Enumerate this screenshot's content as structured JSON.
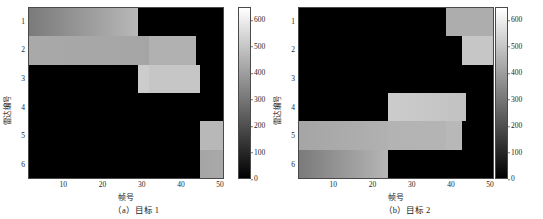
{
  "figure": {
    "title": "",
    "panels": [
      {
        "id": "a",
        "caption": "（a）目标 1",
        "xlabel": "帧号",
        "ylabel": "雷达编号",
        "xticks": [
          "10",
          "20",
          "30",
          "40",
          "50"
        ],
        "yticks": [
          "1",
          "2",
          "3",
          "4",
          "5",
          "6"
        ],
        "colorbar_ticks": [
          "600",
          "500",
          "400",
          "300",
          "200",
          "100",
          "0"
        ]
      },
      {
        "id": "b",
        "caption": "（b）目标 2",
        "xlabel": "帧号",
        "ylabel": "雷达编号",
        "xticks": [
          "10",
          "20",
          "30",
          "40",
          "50"
        ],
        "yticks": [
          "1",
          "2",
          "3",
          "4",
          "5",
          "6"
        ],
        "colorbar_ticks": [
          "600",
          "500",
          "400",
          "300",
          "200",
          "100",
          "0"
        ]
      }
    ]
  },
  "chart_data": [
    {
      "type": "heatmap",
      "panel": "a",
      "title": "（a）目标 1",
      "xlabel": "帧号",
      "ylabel": "雷达编号",
      "xlim": [
        1,
        51
      ],
      "ylim": [
        0.5,
        6.5
      ],
      "xticks": [
        10,
        20,
        30,
        40,
        50
      ],
      "yticks": [
        1,
        2,
        3,
        4,
        5,
        6
      ],
      "colormap": "gray",
      "clim": [
        0,
        650
      ],
      "colorbar_ticks": [
        0,
        100,
        200,
        300,
        400,
        500,
        600
      ],
      "colorbar_position": "right",
      "grid": false,
      "background_value": 0,
      "note": "Value 0 renders black; assigned radar-to-target ranges render as a left-to-right brightening gradient.",
      "blocks": [
        {
          "radar": 1,
          "frame_start": 1,
          "frame_end": 29,
          "value_start": 310,
          "value_end": 470
        },
        {
          "radar": 2,
          "frame_start": 1,
          "frame_end": 32,
          "value_start": 430,
          "value_end": 420
        },
        {
          "radar": 2,
          "frame_start": 32,
          "frame_end": 44,
          "value_start": 450,
          "value_end": 450
        },
        {
          "radar": 3,
          "frame_start": 29,
          "frame_end": 32,
          "value_start": 520,
          "value_end": 520
        },
        {
          "radar": 3,
          "frame_start": 32,
          "frame_end": 45,
          "value_start": 505,
          "value_end": 505
        },
        {
          "radar": 5,
          "frame_start": 45,
          "frame_end": 51,
          "value_start": 470,
          "value_end": 470
        },
        {
          "radar": 6,
          "frame_start": 45,
          "frame_end": 51,
          "value_start": 420,
          "value_end": 430
        }
      ]
    },
    {
      "type": "heatmap",
      "panel": "b",
      "title": "（b）目标 2",
      "xlabel": "帧号",
      "ylabel": "雷达编号",
      "xlim": [
        1,
        51
      ],
      "ylim": [
        0.5,
        6.5
      ],
      "xticks": [
        10,
        20,
        30,
        40,
        50
      ],
      "yticks": [
        1,
        2,
        3,
        4,
        5,
        6
      ],
      "colormap": "gray",
      "clim": [
        0,
        650
      ],
      "colorbar_ticks": [
        0,
        100,
        200,
        300,
        400,
        500,
        600
      ],
      "colorbar_position": "right",
      "grid": false,
      "background_value": 0,
      "note": "Value 0 renders black; assigned radar-to-target ranges render as a left-to-right brightening gradient.",
      "blocks": [
        {
          "radar": 1,
          "frame_start": 39,
          "frame_end": 51,
          "value_start": 440,
          "value_end": 440
        },
        {
          "radar": 2,
          "frame_start": 43,
          "frame_end": 51,
          "value_start": 505,
          "value_end": 505
        },
        {
          "radar": 4,
          "frame_start": 24,
          "frame_end": 44,
          "value_start": 520,
          "value_end": 495
        },
        {
          "radar": 5,
          "frame_start": 1,
          "frame_end": 24,
          "value_start": 420,
          "value_end": 450
        },
        {
          "radar": 5,
          "frame_start": 24,
          "frame_end": 39,
          "value_start": 455,
          "value_end": 460
        },
        {
          "radar": 5,
          "frame_start": 39,
          "frame_end": 43,
          "value_start": 470,
          "value_end": 470
        },
        {
          "radar": 6,
          "frame_start": 1,
          "frame_end": 24,
          "value_start": 310,
          "value_end": 465
        }
      ]
    }
  ]
}
